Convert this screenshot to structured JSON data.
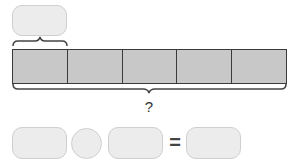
{
  "diagram": {
    "type": "tape-diagram",
    "top_box": {
      "label": ""
    },
    "bar": {
      "segments": [
        {
          "label": ""
        },
        {
          "label": ""
        },
        {
          "label": ""
        },
        {
          "label": ""
        },
        {
          "label": ""
        }
      ],
      "segment_count": 5,
      "fill_color": "#c8c8c8",
      "border_color": "#3a3a3a"
    },
    "total_label": "?",
    "equation": {
      "operand1": "",
      "operator": "",
      "operand2": "",
      "equals_sign": "=",
      "result": ""
    },
    "answer_box_color": "#ececec"
  }
}
